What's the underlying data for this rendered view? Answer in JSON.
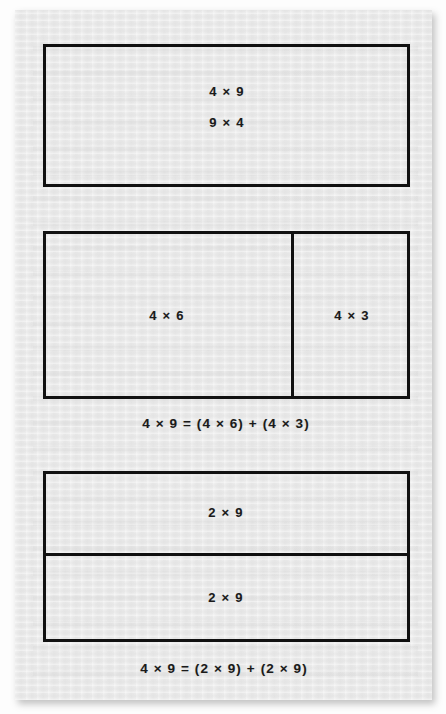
{
  "document": {
    "kind": "math-worksheet-figure",
    "topic": "Distributive property shown with area/array models for 4 x 9",
    "background_color": "#fdfdfd",
    "card_color": "#ececec",
    "line_color": "#111111",
    "text_color": "#1a1a1a"
  },
  "figures": [
    {
      "id": "whole-array",
      "name": "whole-array-model",
      "labels": [
        {
          "id": "whole-a",
          "text": "4 × 9"
        },
        {
          "id": "whole-b",
          "text": "9 × 4"
        }
      ],
      "equation": ""
    },
    {
      "id": "split-4x6-4x3",
      "name": "split-array-model-4x6-plus-4x3",
      "labels": [
        {
          "id": "left-part",
          "text": "4 × 6"
        },
        {
          "id": "right-part",
          "text": "4 × 3"
        }
      ],
      "equation": "4 × 9 = (4 × 6) + (4 × 3)"
    },
    {
      "id": "split-2x9-2x9",
      "name": "split-array-model-2x9-plus-2x9",
      "labels": [
        {
          "id": "top-part",
          "text": "2 × 9"
        },
        {
          "id": "bottom-part",
          "text": "2 × 9"
        }
      ],
      "equation": "4 × 9 = (2 × 9) + (2 × 9)"
    }
  ],
  "chart_data": {
    "type": "table",
    "xlabel": "",
    "ylabel": "",
    "categories": [
      "whole array",
      "split by columns",
      "split by rows"
    ],
    "series": [
      {
        "name": "model labels",
        "values": [
          "4 × 9 / 9 × 4",
          "4 × 6 and 4 × 3",
          "2 × 9 and 2 × 9"
        ]
      },
      {
        "name": "products",
        "values": [
          36,
          36,
          36
        ]
      },
      {
        "name": "part products",
        "values": [
          [
            36
          ],
          [
            24,
            12
          ],
          [
            18,
            18
          ]
        ]
      }
    ],
    "annotations": [
      "4 × 9",
      "9 × 4",
      "4 × 6",
      "4 × 3",
      "4 × 9 = (4 × 6) + (4 × 3)",
      "2 × 9",
      "2 × 9",
      "4 × 9 = (2 × 9) + (2 × 9)"
    ],
    "grid": false,
    "legend": "none"
  }
}
